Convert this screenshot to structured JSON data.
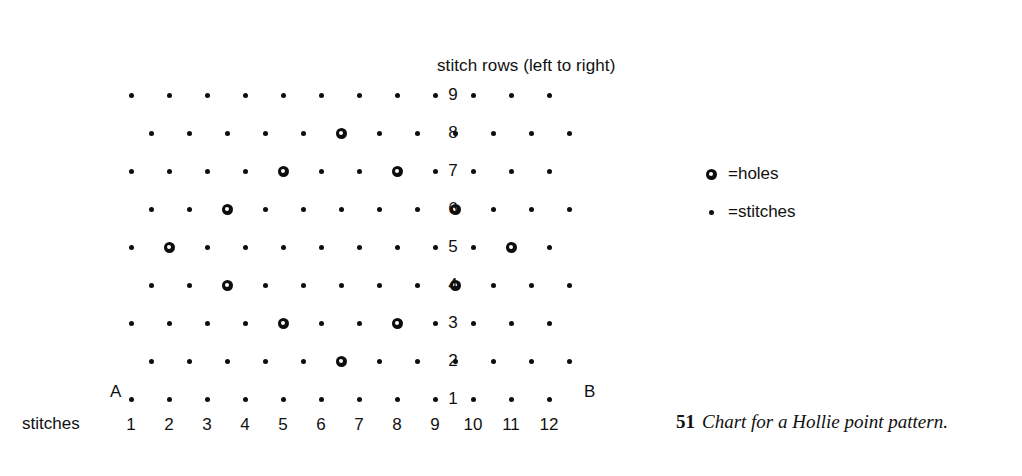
{
  "figure": {
    "chart_title": "stitch  rows (left to right)",
    "axis_label_stitches": "stitches",
    "marker_a": "A",
    "marker_b": "B",
    "row_numbers": [
      "9",
      "8",
      "7",
      "6",
      "5",
      "4",
      "3",
      "2",
      "1"
    ],
    "stitch_numbers": [
      "1",
      "2",
      "3",
      "4",
      "5",
      "6",
      "7",
      "8",
      "9",
      "10",
      "11",
      "12"
    ],
    "legend": [
      {
        "symbol": "hole",
        "text": "=holes"
      },
      {
        "symbol": "stitch",
        "text": "=stitches"
      }
    ],
    "caption": {
      "number": "51",
      "text": "Chart for a Hollie point pattern."
    },
    "colors": {
      "ink": "#0d0d0d",
      "background": "#ffffff"
    }
  },
  "chart_data": {
    "type": "scatter",
    "title": "stitch  rows (left to right)",
    "xlabel": "stitches",
    "ylabel": "stitch rows",
    "grid": false,
    "legend_position": "right",
    "xlim": [
      1,
      12
    ],
    "ylim": [
      1,
      9
    ],
    "x_tick_labels": [
      "1",
      "2",
      "3",
      "4",
      "5",
      "6",
      "7",
      "8",
      "9",
      "10",
      "11",
      "12"
    ],
    "y_tick_labels": [
      "1",
      "2",
      "3",
      "4",
      "5",
      "6",
      "7",
      "8",
      "9"
    ],
    "annotations": [
      "A",
      "B"
    ],
    "series": [
      {
        "name": "holes",
        "marker": "ring",
        "description": "open circle = hole"
      },
      {
        "name": "stitches",
        "marker": "dot",
        "description": "small filled dot = stitch"
      }
    ],
    "rows": [
      {
        "row": 9,
        "offset": 0,
        "marks": [
          "stitch",
          "stitch",
          "stitch",
          "stitch",
          "stitch",
          "stitch",
          "stitch",
          "stitch",
          "stitch",
          "stitch",
          "stitch",
          "stitch"
        ],
        "holes": []
      },
      {
        "row": 8,
        "offset": 1,
        "marks": [
          "stitch",
          "stitch",
          "stitch",
          "stitch",
          "stitch",
          "hole",
          "stitch",
          "stitch",
          "stitch",
          "stitch",
          "stitch",
          "stitch"
        ],
        "holes": [
          6
        ]
      },
      {
        "row": 7,
        "offset": 0,
        "marks": [
          "stitch",
          "stitch",
          "stitch",
          "stitch",
          "hole",
          "stitch",
          "stitch",
          "hole",
          "stitch",
          "stitch",
          "stitch",
          "stitch"
        ],
        "holes": [
          5,
          8
        ]
      },
      {
        "row": 6,
        "offset": 1,
        "marks": [
          "stitch",
          "stitch",
          "hole",
          "stitch",
          "stitch",
          "stitch",
          "stitch",
          "stitch",
          "hole",
          "stitch",
          "stitch",
          "stitch"
        ],
        "holes": [
          3,
          9
        ]
      },
      {
        "row": 5,
        "offset": 0,
        "marks": [
          "stitch",
          "hole",
          "stitch",
          "stitch",
          "stitch",
          "stitch",
          "stitch",
          "stitch",
          "stitch",
          "stitch",
          "hole",
          "stitch"
        ],
        "holes": [
          2,
          11
        ]
      },
      {
        "row": 4,
        "offset": 1,
        "marks": [
          "stitch",
          "stitch",
          "hole",
          "stitch",
          "stitch",
          "stitch",
          "stitch",
          "stitch",
          "hole",
          "stitch",
          "stitch",
          "stitch"
        ],
        "holes": [
          3,
          9
        ]
      },
      {
        "row": 3,
        "offset": 0,
        "marks": [
          "stitch",
          "stitch",
          "stitch",
          "stitch",
          "hole",
          "stitch",
          "stitch",
          "hole",
          "stitch",
          "stitch",
          "stitch",
          "stitch"
        ],
        "holes": [
          5,
          8
        ]
      },
      {
        "row": 2,
        "offset": 1,
        "marks": [
          "stitch",
          "stitch",
          "stitch",
          "stitch",
          "stitch",
          "hole",
          "stitch",
          "stitch",
          "stitch",
          "stitch",
          "stitch",
          "stitch"
        ],
        "holes": [
          6
        ]
      },
      {
        "row": 1,
        "offset": 0,
        "marks": [
          "stitch",
          "stitch",
          "stitch",
          "stitch",
          "stitch",
          "stitch",
          "stitch",
          "stitch",
          "stitch",
          "stitch",
          "stitch",
          "stitch"
        ],
        "holes": []
      }
    ]
  }
}
